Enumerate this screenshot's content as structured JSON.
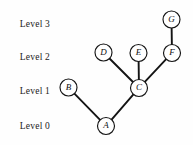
{
  "diagram": {
    "background_color": "#fefefe",
    "stroke_color": "#141414",
    "node_fill_color": "#ffffff",
    "text_color": "#111111"
  },
  "level_labels": [
    {
      "id": "level-3",
      "text": "Level 3",
      "x": 50,
      "y": 27,
      "level": 3
    },
    {
      "id": "level-2",
      "text": "Level 2",
      "x": 50,
      "y": 60,
      "level": 2
    },
    {
      "id": "level-1",
      "text": "Level 1",
      "x": 50,
      "y": 94,
      "level": 1
    },
    {
      "id": "level-0",
      "text": "Level 0",
      "x": 50,
      "y": 129,
      "level": 0
    }
  ],
  "nodes": [
    {
      "id": "A",
      "label": "A",
      "cx": 106,
      "cy": 126,
      "r": 8.5,
      "level": 0
    },
    {
      "id": "B",
      "label": "B",
      "cx": 68.5,
      "cy": 87.5,
      "r": 8.5,
      "level": 1
    },
    {
      "id": "C",
      "label": "C",
      "cx": 139,
      "cy": 88,
      "r": 8.5,
      "level": 1
    },
    {
      "id": "D",
      "label": "D",
      "cx": 103.5,
      "cy": 52.5,
      "r": 8.5,
      "level": 2
    },
    {
      "id": "E",
      "label": "E",
      "cx": 138.5,
      "cy": 53,
      "r": 8.5,
      "level": 2
    },
    {
      "id": "F",
      "label": "F",
      "cx": 172,
      "cy": 53,
      "r": 8.5,
      "level": 2
    },
    {
      "id": "G",
      "label": "G",
      "cx": 171.5,
      "cy": 19.5,
      "r": 8.5,
      "level": 3
    }
  ],
  "edges": [
    {
      "id": "edge-A-B",
      "from": "A",
      "to": "B"
    },
    {
      "id": "edge-A-C",
      "from": "A",
      "to": "C"
    },
    {
      "id": "edge-C-D",
      "from": "C",
      "to": "D"
    },
    {
      "id": "edge-C-E",
      "from": "C",
      "to": "E"
    },
    {
      "id": "edge-C-F",
      "from": "C",
      "to": "F"
    },
    {
      "id": "edge-F-G",
      "from": "F",
      "to": "G"
    }
  ]
}
